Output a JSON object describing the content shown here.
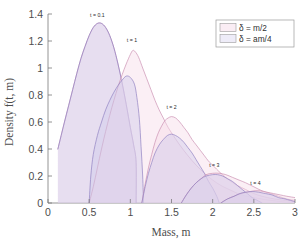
{
  "chart_data": {
    "type": "area",
    "title": "",
    "xlabel": "Mass, m",
    "ylabel": "Density f(t, m)",
    "xlim": [
      0,
      3
    ],
    "ylim": [
      0,
      1.4
    ],
    "xticks": [
      0,
      0.5,
      1,
      1.5,
      2,
      2.5,
      3
    ],
    "xticklabels": [
      "0",
      "0.5",
      "1",
      "1.5",
      "2",
      "2.5",
      "3"
    ],
    "yticks": [
      0,
      0.2,
      0.4,
      0.6,
      0.8,
      1,
      1.2,
      1.4
    ],
    "yticklabels": [
      "0",
      "0.2",
      "0.4",
      "0.6",
      "0.8",
      "1",
      "1.2",
      "1.4"
    ],
    "grid": false,
    "legend_position": "top-right",
    "legend": [
      {
        "label": "δ = m/2",
        "color": "#f2d7e6"
      },
      {
        "label": "δ = am/4",
        "color": "#d6d2ee"
      }
    ],
    "annotations": [
      {
        "text": "t = 0.1",
        "x": 0.6,
        "y": 1.38
      },
      {
        "text": "t = 1",
        "x": 1.02,
        "y": 1.19
      },
      {
        "text": "t = 2",
        "x": 1.5,
        "y": 0.7
      },
      {
        "text": "t = 3",
        "x": 2.02,
        "y": 0.27
      },
      {
        "text": "t = 4",
        "x": 2.52,
        "y": 0.13
      }
    ],
    "series": [
      {
        "name": "t = 0.1, δ = m/2",
        "family": "m/2",
        "t": 0.1,
        "peak_x": 0.6,
        "peak_y": 1.33,
        "points": [
          [
            0.12,
            0.4
          ],
          [
            0.16,
            0.5
          ],
          [
            0.2,
            0.6
          ],
          [
            0.25,
            0.72
          ],
          [
            0.3,
            0.84
          ],
          [
            0.35,
            0.96
          ],
          [
            0.4,
            1.07
          ],
          [
            0.45,
            1.16
          ],
          [
            0.5,
            1.24
          ],
          [
            0.55,
            1.3
          ],
          [
            0.6,
            1.33
          ],
          [
            0.65,
            1.33
          ],
          [
            0.7,
            1.3
          ],
          [
            0.75,
            1.24
          ],
          [
            0.8,
            1.15
          ],
          [
            0.85,
            1.03
          ],
          [
            0.9,
            0.89
          ],
          [
            0.95,
            0.73
          ],
          [
            1.0,
            0.56
          ],
          [
            1.04,
            0.43
          ],
          [
            1.07,
            0.3
          ],
          [
            1.07,
            0.0
          ]
        ]
      },
      {
        "name": "t = 0.1, δ = am/4",
        "family": "am/4",
        "t": 0.1,
        "peak_x": 0.6,
        "peak_y": 1.33,
        "points": [
          [
            0.12,
            0.4
          ],
          [
            0.16,
            0.5
          ],
          [
            0.2,
            0.6
          ],
          [
            0.25,
            0.72
          ],
          [
            0.3,
            0.84
          ],
          [
            0.35,
            0.96
          ],
          [
            0.4,
            1.07
          ],
          [
            0.45,
            1.16
          ],
          [
            0.5,
            1.24
          ],
          [
            0.55,
            1.3
          ],
          [
            0.6,
            1.33
          ],
          [
            0.65,
            1.33
          ],
          [
            0.7,
            1.3
          ],
          [
            0.75,
            1.24
          ],
          [
            0.8,
            1.15
          ],
          [
            0.85,
            1.03
          ],
          [
            0.9,
            0.89
          ],
          [
            0.95,
            0.73
          ],
          [
            1.0,
            0.56
          ],
          [
            1.04,
            0.43
          ],
          [
            1.07,
            0.3
          ],
          [
            1.07,
            0.0
          ]
        ]
      },
      {
        "name": "t = 1, δ = m/2",
        "family": "m/2",
        "t": 1,
        "peak_x": 1.03,
        "peak_y": 1.13,
        "points": [
          [
            0.5,
            0.0
          ],
          [
            0.55,
            0.12
          ],
          [
            0.6,
            0.26
          ],
          [
            0.65,
            0.4
          ],
          [
            0.7,
            0.53
          ],
          [
            0.75,
            0.65
          ],
          [
            0.8,
            0.76
          ],
          [
            0.85,
            0.86
          ],
          [
            0.9,
            0.95
          ],
          [
            0.95,
            1.03
          ],
          [
            1.0,
            1.1
          ],
          [
            1.03,
            1.13
          ],
          [
            1.06,
            1.12
          ],
          [
            1.1,
            1.08
          ],
          [
            1.15,
            1.0
          ],
          [
            1.2,
            0.92
          ],
          [
            1.25,
            0.84
          ],
          [
            1.3,
            0.76
          ],
          [
            1.35,
            0.69
          ],
          [
            1.4,
            0.63
          ],
          [
            1.45,
            0.57
          ],
          [
            1.5,
            0.52
          ],
          [
            1.6,
            0.43
          ],
          [
            1.7,
            0.35
          ],
          [
            1.8,
            0.28
          ],
          [
            1.9,
            0.22
          ],
          [
            2.0,
            0.17
          ],
          [
            2.1,
            0.13
          ],
          [
            2.2,
            0.1
          ],
          [
            2.35,
            0.06
          ],
          [
            2.5,
            0.04
          ],
          [
            2.7,
            0.02
          ],
          [
            3.0,
            0.0
          ]
        ]
      },
      {
        "name": "t = 1, δ = am/4",
        "family": "am/4",
        "t": 1,
        "peak_x": 0.95,
        "peak_y": 0.94,
        "points": [
          [
            0.5,
            0.0
          ],
          [
            0.52,
            0.2
          ],
          [
            0.55,
            0.36
          ],
          [
            0.6,
            0.5
          ],
          [
            0.65,
            0.6
          ],
          [
            0.7,
            0.69
          ],
          [
            0.75,
            0.76
          ],
          [
            0.8,
            0.82
          ],
          [
            0.85,
            0.87
          ],
          [
            0.9,
            0.91
          ],
          [
            0.95,
            0.94
          ],
          [
            1.0,
            0.93
          ],
          [
            1.05,
            0.88
          ],
          [
            1.08,
            0.78
          ],
          [
            1.11,
            0.62
          ],
          [
            1.13,
            0.42
          ],
          [
            1.15,
            0.2
          ],
          [
            1.16,
            0.0
          ]
        ]
      },
      {
        "name": "t = 2, δ = m/2",
        "family": "m/2",
        "t": 2,
        "peak_x": 1.5,
        "peak_y": 0.64,
        "points": [
          [
            1.14,
            0.0
          ],
          [
            1.18,
            0.14
          ],
          [
            1.22,
            0.26
          ],
          [
            1.26,
            0.36
          ],
          [
            1.3,
            0.45
          ],
          [
            1.34,
            0.52
          ],
          [
            1.38,
            0.57
          ],
          [
            1.42,
            0.61
          ],
          [
            1.46,
            0.63
          ],
          [
            1.5,
            0.64
          ],
          [
            1.55,
            0.63
          ],
          [
            1.6,
            0.6
          ],
          [
            1.65,
            0.56
          ],
          [
            1.7,
            0.52
          ],
          [
            1.75,
            0.47
          ],
          [
            1.8,
            0.43
          ],
          [
            1.85,
            0.39
          ],
          [
            1.9,
            0.35
          ],
          [
            1.95,
            0.31
          ],
          [
            2.0,
            0.28
          ],
          [
            2.1,
            0.22
          ],
          [
            2.2,
            0.17
          ],
          [
            2.3,
            0.13
          ],
          [
            2.4,
            0.1
          ],
          [
            2.5,
            0.07
          ],
          [
            2.6,
            0.05
          ],
          [
            2.75,
            0.03
          ],
          [
            3.0,
            0.01
          ]
        ]
      },
      {
        "name": "t = 2, δ = am/4",
        "family": "am/4",
        "t": 2,
        "peak_x": 1.5,
        "peak_y": 0.51,
        "points": [
          [
            1.14,
            0.0
          ],
          [
            1.18,
            0.12
          ],
          [
            1.22,
            0.22
          ],
          [
            1.26,
            0.3
          ],
          [
            1.3,
            0.37
          ],
          [
            1.35,
            0.43
          ],
          [
            1.4,
            0.47
          ],
          [
            1.45,
            0.5
          ],
          [
            1.5,
            0.51
          ],
          [
            1.55,
            0.5
          ],
          [
            1.6,
            0.48
          ],
          [
            1.65,
            0.45
          ],
          [
            1.7,
            0.41
          ],
          [
            1.75,
            0.37
          ],
          [
            1.8,
            0.32
          ],
          [
            1.85,
            0.27
          ],
          [
            1.9,
            0.22
          ],
          [
            1.95,
            0.16
          ],
          [
            2.0,
            0.11
          ],
          [
            2.05,
            0.05
          ],
          [
            2.08,
            0.0
          ]
        ]
      },
      {
        "name": "t = 3, δ = m/2",
        "family": "m/2",
        "t": 3,
        "peak_x": 2.0,
        "peak_y": 0.22,
        "points": [
          [
            1.62,
            0.0
          ],
          [
            1.68,
            0.06
          ],
          [
            1.74,
            0.11
          ],
          [
            1.8,
            0.15
          ],
          [
            1.86,
            0.18
          ],
          [
            1.92,
            0.21
          ],
          [
            2.0,
            0.22
          ],
          [
            2.08,
            0.22
          ],
          [
            2.16,
            0.21
          ],
          [
            2.24,
            0.19
          ],
          [
            2.32,
            0.17
          ],
          [
            2.4,
            0.15
          ],
          [
            2.5,
            0.12
          ],
          [
            2.6,
            0.09
          ],
          [
            2.7,
            0.07
          ],
          [
            2.8,
            0.05
          ],
          [
            2.9,
            0.03
          ],
          [
            3.0,
            0.02
          ]
        ]
      },
      {
        "name": "t = 3, δ = am/4",
        "family": "am/4",
        "t": 3,
        "peak_x": 2.0,
        "peak_y": 0.21,
        "points": [
          [
            1.62,
            0.0
          ],
          [
            1.68,
            0.06
          ],
          [
            1.74,
            0.11
          ],
          [
            1.8,
            0.15
          ],
          [
            1.86,
            0.18
          ],
          [
            1.92,
            0.2
          ],
          [
            2.0,
            0.21
          ],
          [
            2.06,
            0.21
          ],
          [
            2.12,
            0.2
          ],
          [
            2.18,
            0.18
          ],
          [
            2.24,
            0.16
          ],
          [
            2.3,
            0.13
          ],
          [
            2.36,
            0.1
          ],
          [
            2.42,
            0.07
          ],
          [
            2.48,
            0.04
          ],
          [
            2.54,
            0.02
          ],
          [
            2.6,
            0.0
          ]
        ]
      },
      {
        "name": "t = 4, δ = m/2",
        "family": "m/2",
        "t": 4,
        "peak_x": 2.5,
        "peak_y": 0.09,
        "points": [
          [
            2.1,
            0.0
          ],
          [
            2.18,
            0.03
          ],
          [
            2.26,
            0.05
          ],
          [
            2.34,
            0.07
          ],
          [
            2.42,
            0.08
          ],
          [
            2.5,
            0.09
          ],
          [
            2.58,
            0.09
          ],
          [
            2.66,
            0.08
          ],
          [
            2.74,
            0.07
          ],
          [
            2.82,
            0.06
          ],
          [
            2.9,
            0.05
          ],
          [
            3.0,
            0.04
          ]
        ]
      },
      {
        "name": "t = 4, δ = am/4",
        "family": "am/4",
        "t": 4,
        "peak_x": 2.48,
        "peak_y": 0.085,
        "points": [
          [
            2.1,
            0.0
          ],
          [
            2.18,
            0.03
          ],
          [
            2.26,
            0.05
          ],
          [
            2.33,
            0.07
          ],
          [
            2.4,
            0.08
          ],
          [
            2.48,
            0.085
          ],
          [
            2.56,
            0.08
          ],
          [
            2.64,
            0.07
          ],
          [
            2.72,
            0.06
          ],
          [
            2.8,
            0.04
          ],
          [
            2.88,
            0.03
          ],
          [
            3.0,
            0.01
          ]
        ]
      }
    ]
  },
  "axes": {
    "xlabel": "Mass, m",
    "xlabel_prefix": "Mass,",
    "xlabel_var": "m",
    "ylabel_prefix": "Density",
    "ylabel_fn": "f(t, m)"
  },
  "colors": {
    "pink_fill": "#f6dbe9",
    "pink_line": "#c98fb0",
    "purple_fill": "#cfc9ec",
    "purple_line": "#8f7fc0",
    "axis": "#6b6b6b",
    "text": "#4d4d4d"
  }
}
